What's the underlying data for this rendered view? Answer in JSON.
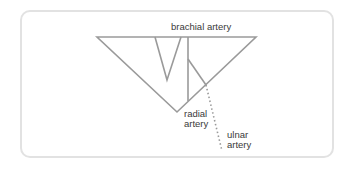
{
  "diagram": {
    "labels": {
      "brachial": "brachial artery",
      "radial_line1": "radial",
      "radial_line2": "artery",
      "ulnar_line1": "ulnar",
      "ulnar_line2": "artery"
    },
    "colors": {
      "stroke": "#9a9a9a",
      "frame": "#e2e2e2",
      "text": "#3a3a3a"
    }
  }
}
